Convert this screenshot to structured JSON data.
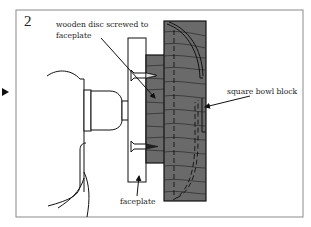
{
  "figure": {
    "step_number": "2",
    "labels": {
      "wooden_disc_line1": "wooden disc screwed to",
      "wooden_disc_line2": "faceplate",
      "square_bowl_block": "square bowl block",
      "faceplate": "faceplate"
    },
    "colors": {
      "wood": "#6a6a6a",
      "outline": "#111111",
      "frame": "#8a8a8a"
    }
  }
}
